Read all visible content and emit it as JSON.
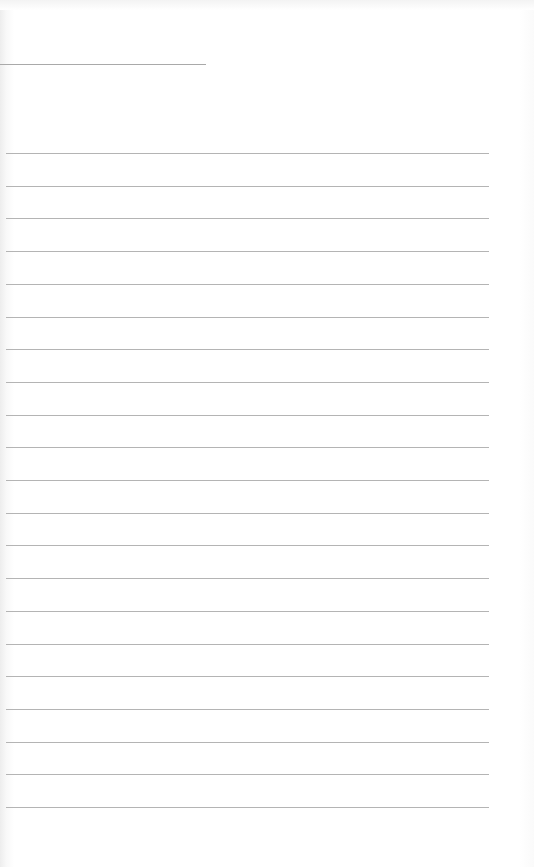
{
  "document": {
    "type": "lined notebook page",
    "header": {
      "title_line_text": ""
    },
    "ruled_line_count": 21,
    "lines": [
      "",
      "",
      "",
      "",
      "",
      "",
      "",
      "",
      "",
      "",
      "",
      "",
      "",
      "",
      "",
      "",
      "",
      "",
      "",
      "",
      ""
    ],
    "rule_color": "#b4b4b4",
    "paper_color": "#ffffff"
  }
}
